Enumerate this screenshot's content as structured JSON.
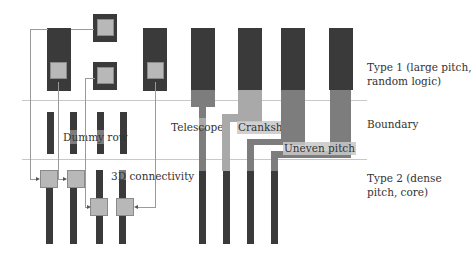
{
  "figure": {
    "regions": [
      {
        "id": "type1",
        "label": "Type 1 (large pitch,\nrandom logic)",
        "line1": "Type 1 (large pitch,",
        "line2": "random logic)"
      },
      {
        "id": "boundary",
        "label": "Boundary"
      },
      {
        "id": "type2",
        "label": "Type 2 (dense pitch, core)",
        "line1": "Type 2 (dense",
        "line2": "pitch, core)"
      }
    ],
    "annotations": {
      "dummy_row": "Dummy row",
      "connectivity": "3D connectivity",
      "telescope": "Telescope",
      "crankshaft": "Crankshaft",
      "uneven_pitch": "Uneven pitch"
    },
    "colors": {
      "dark_pillar": "#3a3a3a",
      "mid_transition": "#7d7d7d",
      "light_transition": "#a9a9a9",
      "via_pad": "#b8b8b8",
      "boundary_line": "#c8c8c8",
      "wire": "#9a9a9a"
    }
  }
}
